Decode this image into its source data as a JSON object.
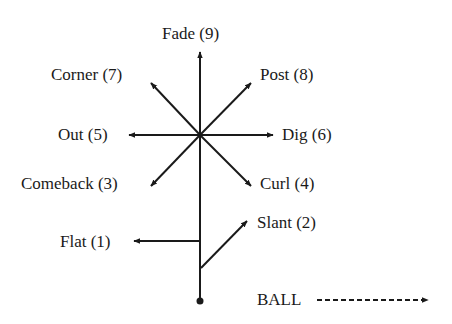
{
  "diagram": {
    "title": "",
    "routes": [
      {
        "id": "flat",
        "label": "Flat (1)",
        "number": 1
      },
      {
        "id": "slant",
        "label": "Slant (2)",
        "number": 2
      },
      {
        "id": "comeback",
        "label": "Comeback (3)",
        "number": 3
      },
      {
        "id": "curl",
        "label": "Curl (4)",
        "number": 4
      },
      {
        "id": "out",
        "label": "Out (5)",
        "number": 5
      },
      {
        "id": "dig",
        "label": "Dig (6)",
        "number": 6
      },
      {
        "id": "corner",
        "label": "Corner (7)",
        "number": 7
      },
      {
        "id": "post",
        "label": "Post (8)",
        "number": 8
      },
      {
        "id": "fade",
        "label": "Fade (9)",
        "number": 9
      }
    ],
    "ball_label": "BALL",
    "colors": {
      "line": "#1a1a1a",
      "background": "#ffffff"
    }
  }
}
